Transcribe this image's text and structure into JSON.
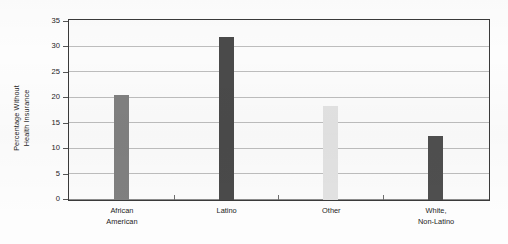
{
  "chart_data": {
    "type": "bar",
    "title": "",
    "subtitle": "",
    "xlabel": "",
    "ylabel": "Percentage Without Health Insurance",
    "ylabel_lines": [
      "Percentage Without",
      "Health Insurance"
    ],
    "categories": [
      "African American",
      "Latino",
      "Other",
      "White, Non-Latino"
    ],
    "category_lines": [
      [
        "African",
        "American"
      ],
      [
        "Latino"
      ],
      [
        "Other"
      ],
      [
        "White,",
        "Non-Latino"
      ]
    ],
    "values": [
      20.5,
      32.0,
      18.5,
      12.5
    ],
    "bar_colors": [
      "#808080",
      "#4a4a4a",
      "#e2e2e2",
      "#4f4f4f"
    ],
    "ylim": [
      0,
      35
    ],
    "ytick_values": [
      0,
      5,
      10,
      15,
      20,
      25,
      30,
      35
    ],
    "ytick_labels": [
      "0",
      "5",
      "10",
      "15",
      "20",
      "25",
      "30",
      "35"
    ],
    "grid": true,
    "grid_axis": "y",
    "legend": false,
    "legend_position": "none",
    "frame": true,
    "frame_color": "#3a3a3a",
    "gridline_color": "#bdbdbd",
    "plot_background": "#fbfbfb",
    "figure_background": "#fdfdfd"
  }
}
